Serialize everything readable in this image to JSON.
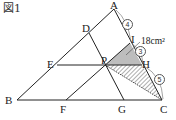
{
  "figure": {
    "title": "図1",
    "points": {
      "A": "A",
      "B": "B",
      "C": "C",
      "D": "D",
      "E": "E",
      "F": "F",
      "G": "G",
      "H": "H",
      "I": "I",
      "P": "P"
    },
    "ratios": {
      "AI": "4",
      "IH": "3",
      "HC": "5"
    },
    "area_label": "18cm²",
    "colors": {
      "shaded": "#bdbdbd",
      "lines": "#222222",
      "hatch": "#333333"
    }
  }
}
